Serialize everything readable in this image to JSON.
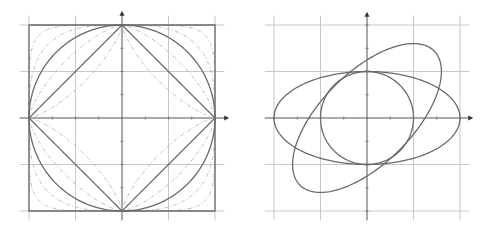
{
  "figure": {
    "panels": [
      {
        "id": "left",
        "title": "",
        "center_px": [
          122,
          118
        ],
        "unit_px": 93,
        "grid_step_units": 0.5,
        "grid_range_units": [
          -1,
          1
        ],
        "line_extent_units": 1.1,
        "arrow_tip_units": 1.12,
        "description": "Unit balls of Lp norms",
        "shapes": [
          {
            "name": "linf-square",
            "kind": "superellipse",
            "p": "inf",
            "style": "main"
          },
          {
            "name": "l2-circle",
            "kind": "superellipse",
            "p": 2,
            "style": "main"
          },
          {
            "name": "l1-diamond",
            "kind": "superellipse",
            "p": 1,
            "style": "main"
          },
          {
            "name": "lp-0.7-curve",
            "kind": "superellipse",
            "p": 0.75,
            "style": "dashed"
          },
          {
            "name": "lp-1.5-curve",
            "kind": "superellipse",
            "p": 1.4,
            "style": "dashed"
          },
          {
            "name": "lp-3-curve",
            "kind": "superellipse",
            "p": 3,
            "style": "dashed"
          },
          {
            "name": "lp-6-curve",
            "kind": "superellipse",
            "p": 6,
            "style": "dashed"
          }
        ]
      },
      {
        "id": "right",
        "title": "",
        "center_px": [
          367,
          118
        ],
        "unit_px": 46.5,
        "grid_step_units": 1,
        "grid_range_units": [
          -2,
          2
        ],
        "line_extent_units": 2.2,
        "arrow_tip_units": 2.22,
        "description": "Unit circle and its images under linear maps (ellipses)",
        "shapes": [
          {
            "name": "unit-circle",
            "kind": "ellipse",
            "a": 1,
            "b": 1,
            "angle_deg": 0,
            "style": "main"
          },
          {
            "name": "horizontal-ellipse",
            "kind": "ellipse",
            "a": 2,
            "b": 1,
            "angle_deg": 0,
            "style": "main"
          },
          {
            "name": "tilted-ellipse",
            "kind": "ellipse",
            "a": 2.04,
            "b": 0.98,
            "angle_deg": 45,
            "style": "main"
          }
        ]
      }
    ]
  }
}
